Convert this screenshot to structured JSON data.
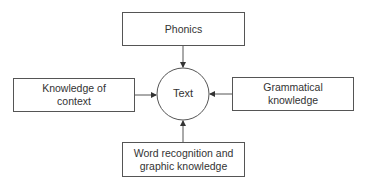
{
  "diagram": {
    "center": {
      "label": "Text",
      "shape": "circle"
    },
    "nodes": [
      {
        "id": "phonics",
        "label": "Phonics",
        "position": "top"
      },
      {
        "id": "context",
        "label": "Knowledge of context",
        "position": "left"
      },
      {
        "id": "grammar",
        "label": "Grammatical knowledge",
        "position": "right"
      },
      {
        "id": "word",
        "label": "Word recognition and graphic knowledge",
        "position": "bottom"
      }
    ],
    "edges": [
      {
        "from": "phonics",
        "to": "center"
      },
      {
        "from": "context",
        "to": "center"
      },
      {
        "from": "grammar",
        "to": "center"
      },
      {
        "from": "word",
        "to": "center"
      }
    ],
    "colors": {
      "stroke": "#555555",
      "text": "#333333",
      "background": "#ffffff"
    }
  }
}
